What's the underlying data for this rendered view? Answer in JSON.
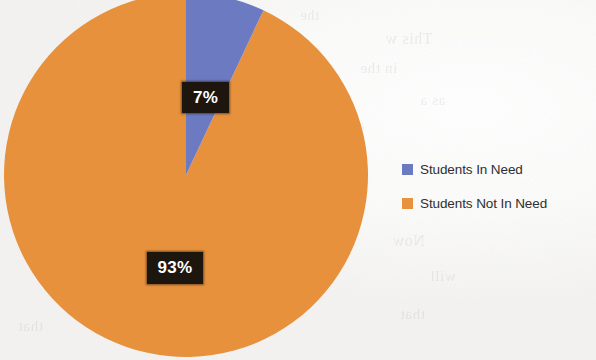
{
  "chart_data": {
    "type": "pie",
    "title": "",
    "categories": [
      "Students In Need",
      "Students Not In Need"
    ],
    "values": [
      7,
      93
    ],
    "value_labels": [
      "7%",
      "93%"
    ],
    "colors": [
      "#6C7AC2",
      "#E8913E"
    ],
    "units": "percent",
    "start_angle_deg": 0,
    "direction": "clockwise",
    "legend_position": "right",
    "grid": false,
    "series": [
      {
        "name": "Students",
        "slices": [
          {
            "label": "Students In Need",
            "value": 7,
            "display": "7%",
            "color": "#6C7AC2"
          },
          {
            "label": "Students Not In Need",
            "value": 93,
            "display": "93%",
            "color": "#E8913E"
          }
        ]
      }
    ]
  },
  "pie": {
    "slices": [
      {
        "name": "Students In Need",
        "percent_label": "7%",
        "color": "#6C7AC2"
      },
      {
        "name": "Students Not In Need",
        "percent_label": "93%",
        "color": "#E8913E"
      }
    ]
  },
  "legend": {
    "items": [
      {
        "label": "Students In Need",
        "color": "#6C7AC2"
      },
      {
        "label": "Students Not In Need",
        "color": "#E8913E"
      }
    ]
  },
  "background": {
    "bleed_text": [
      "the",
      "This w",
      "in the",
      "as a",
      "an",
      "Now",
      "will",
      "that"
    ]
  }
}
